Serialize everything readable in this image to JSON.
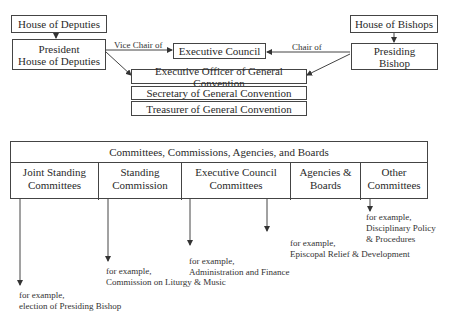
{
  "top": {
    "house_of_deputies": "House of Deputies",
    "president_hod": [
      "President",
      "House of Deputies"
    ],
    "house_of_bishops": "House of Bishops",
    "presiding_bishop": [
      "Presiding",
      "Bishop"
    ],
    "executive_council": "Executive Council",
    "executive_officer": "Executive Officer of General Convention",
    "secretary": "Secretary of General Convention",
    "treasurer": "Treasurer of General Convention",
    "edge_vice_chair": "Vice Chair of",
    "edge_chair": "Chair of"
  },
  "table": {
    "header": "Committees, Commissions, Agencies, and Boards",
    "columns": [
      {
        "label": [
          "Joint Standing",
          "Committees"
        ],
        "example": [
          "for example,",
          "election of Presiding Bishop"
        ]
      },
      {
        "label": [
          "Standing",
          "Commission"
        ],
        "example": [
          "for example,",
          "Commission on Liturgy & Music"
        ]
      },
      {
        "label": [
          "Executive Council",
          "Committees"
        ],
        "example": [
          "for example,",
          "Administration and Finance"
        ]
      },
      {
        "label": [
          "Agencies &",
          "Boards"
        ],
        "example": [
          "for example,",
          "Episcopal Relief & Development"
        ]
      },
      {
        "label": [
          "Other",
          "Committees"
        ],
        "example": [
          "for example,",
          "Disciplinary Policy",
          "& Procedures"
        ]
      }
    ]
  },
  "colors": {
    "line": "#444444",
    "text": "#2a2a2a",
    "background": "#ffffff"
  }
}
